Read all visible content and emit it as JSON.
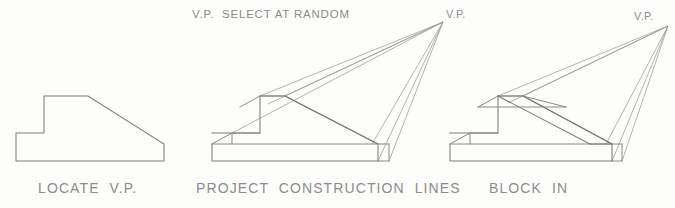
{
  "page": {
    "width": 675,
    "height": 208,
    "background_color": "#fdfdfb",
    "line_color": "#8a8a8a",
    "text_color": "#8c8c8c"
  },
  "annotations": {
    "random_note_vp": "V.P.",
    "random_note_text": "SELECT AT RANDOM",
    "vp_label_middle": "V.P.",
    "vp_label_right": "V.P."
  },
  "figures": [
    {
      "id": "locate-vp",
      "caption": "LOCATE  V.P.",
      "caption_x": 38,
      "caption_y": 180,
      "description": "Flat orthographic side profile of a stepped wedge block"
    },
    {
      "id": "project-construction-lines",
      "caption": "PROJECT  CONSTRUCTION  LINES",
      "caption_x": 196,
      "caption_y": 180,
      "description": "Side profile with construction lines projected back to the vanishing point"
    },
    {
      "id": "block-in",
      "caption": "BLOCK  IN",
      "caption_x": 489,
      "caption_y": 180,
      "description": "Completed blocked-in perspective solid with depth plane established"
    }
  ],
  "vanishing_points": {
    "middle": {
      "x": 443,
      "y": 22
    },
    "right": {
      "x": 668,
      "y": 26
    }
  }
}
